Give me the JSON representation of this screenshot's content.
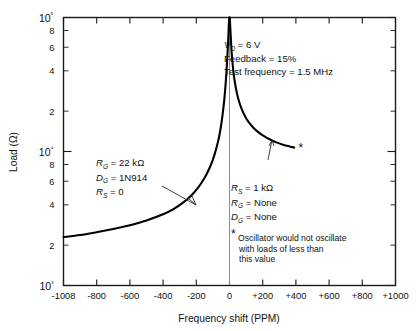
{
  "chart_data": {
    "type": "line",
    "title": "",
    "xlabel": "Frequency shift (PPM)",
    "ylabel": "Load (Ω)",
    "xlim": [
      -1000,
      1000
    ],
    "ylim": [
      1000,
      100000
    ],
    "yscale": "log",
    "grid": false,
    "legend": null,
    "x_ticks": [
      -1000,
      -800,
      -600,
      -400,
      -200,
      0,
      200,
      400,
      600,
      800,
      1000
    ],
    "x_tick_labels": [
      "-1008",
      "-800",
      "-600",
      "-400",
      "-200",
      "0",
      "+200",
      "+400",
      "+600",
      "+800",
      "+1000"
    ],
    "y_major_ticks": [
      1000,
      10000,
      100000
    ],
    "y_major_labels": [
      "10³",
      "10⁴",
      "10⁵"
    ],
    "y_minor_ticks": [
      2000,
      4000,
      6000,
      8000,
      20000,
      40000,
      60000,
      80000
    ],
    "y_minor_labels": [
      "2",
      "4",
      "6",
      "8",
      "2",
      "4",
      "6",
      "8"
    ],
    "series": [
      {
        "name": "left-branch",
        "comment": "R_G = 22 kOhm, D_G = 1N914, R_S = 0",
        "points": [
          [
            -1000,
            2300
          ],
          [
            -900,
            2380
          ],
          [
            -800,
            2500
          ],
          [
            -700,
            2640
          ],
          [
            -600,
            2820
          ],
          [
            -500,
            3060
          ],
          [
            -400,
            3400
          ],
          [
            -340,
            3700
          ],
          [
            -280,
            4150
          ],
          [
            -230,
            4700
          ],
          [
            -190,
            5350
          ],
          [
            -155,
            6200
          ],
          [
            -125,
            7300
          ],
          [
            -100,
            8700
          ],
          [
            -80,
            10500
          ],
          [
            -62,
            13000
          ],
          [
            -48,
            16500
          ],
          [
            -36,
            21500
          ],
          [
            -26,
            29000
          ],
          [
            -18,
            40000
          ],
          [
            -12,
            54000
          ],
          [
            -7,
            72000
          ],
          [
            -4,
            88000
          ],
          [
            -2,
            97000
          ],
          [
            -1,
            100000
          ]
        ]
      },
      {
        "name": "right-branch",
        "comment": "R_S = 1 kOhm, R_G = None, D_G = None",
        "points": [
          [
            1,
            100000
          ],
          [
            2,
            97000
          ],
          [
            4,
            88000
          ],
          [
            7,
            74000
          ],
          [
            11,
            60000
          ],
          [
            16,
            49000
          ],
          [
            23,
            40000
          ],
          [
            32,
            33000
          ],
          [
            44,
            27500
          ],
          [
            58,
            23500
          ],
          [
            75,
            20500
          ],
          [
            95,
            18200
          ],
          [
            118,
            16400
          ],
          [
            145,
            15000
          ],
          [
            175,
            13900
          ],
          [
            208,
            13000
          ],
          [
            244,
            12300
          ],
          [
            282,
            11700
          ],
          [
            322,
            11250
          ],
          [
            363,
            10900
          ],
          [
            390,
            10700
          ]
        ]
      }
    ],
    "markers": [
      {
        "name": "asterisk-marker",
        "symbol": "*",
        "x": 430,
        "y": 10700
      }
    ],
    "annotations": {
      "conditions": [
        {
          "label": "V",
          "sub": "D",
          "value": " = 6 V"
        },
        {
          "label": "Feedback",
          "sub": "",
          "value": " = 15%"
        },
        {
          "label": "Test frequency",
          "sub": "",
          "value": " = 1.5 MHz"
        }
      ],
      "left_block": [
        {
          "label": "R",
          "sub": "G",
          "value": " = 22 kΩ"
        },
        {
          "label": "D",
          "sub": "G",
          "value": " = 1N914"
        },
        {
          "label": "R",
          "sub": "S",
          "value": " = 0"
        }
      ],
      "right_block": [
        {
          "label": "R",
          "sub": "S",
          "value": " = 1 kΩ"
        },
        {
          "label": "R",
          "sub": "G",
          "value": " = None"
        },
        {
          "label": "D",
          "sub": "G",
          "value": " = None"
        }
      ],
      "footnote": {
        "symbol": "*",
        "lines": [
          "Oscillator would not oscillate",
          "with loads of less than",
          "this value"
        ]
      }
    },
    "colors": {
      "curve": "#000000",
      "frame": "#1a1a1a",
      "zeroline": "#8d8d8d",
      "text": "#111111",
      "background": "#ffffff"
    }
  }
}
